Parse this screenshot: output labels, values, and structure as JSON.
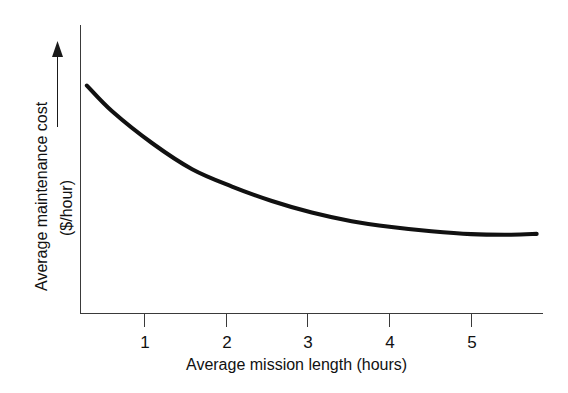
{
  "chart_data": {
    "type": "line",
    "title": "",
    "subtitle": "",
    "xlabel": "Average mission length (hours)",
    "ylabel": "Average maintenance cost ($/hour)",
    "ylabel_lines": [
      "Average maintenance cost",
      "($/hour)"
    ],
    "x_tick_labels": [
      "1",
      "2",
      "3",
      "4",
      "5"
    ],
    "x_ticks": [
      1,
      2,
      3,
      4,
      5
    ],
    "y_tick_labels": [],
    "xlim": [
      0.1,
      5.9
    ],
    "ylim": [
      0,
      100
    ],
    "grid": false,
    "legend": false,
    "legend_position": "none",
    "y_axis_arrow": true,
    "y_axis_arrow_meaning": "increasing",
    "annotations": [],
    "series": [
      {
        "name": "Average maintenance cost",
        "color": "#111111",
        "x": [
          0.18,
          0.5,
          1.0,
          1.5,
          2.0,
          2.5,
          3.0,
          3.5,
          4.0,
          4.5,
          5.0,
          5.5,
          5.82
        ],
        "values": [
          79,
          70,
          59,
          50,
          44,
          39,
          35,
          32,
          30,
          28.5,
          27.5,
          27.3,
          27.6
        ]
      }
    ]
  },
  "figure": {
    "background_color": "#ffffff",
    "axis_color": "#3a3a3a",
    "curve_color": "#111111",
    "width": 568,
    "height": 393
  }
}
